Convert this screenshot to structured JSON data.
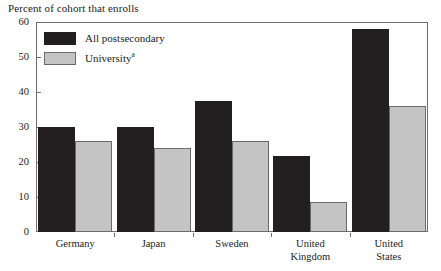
{
  "chart_data": {
    "type": "bar",
    "title": "Percent of cohort that enrolls",
    "xlabel": "",
    "ylabel": "",
    "ylim": [
      0,
      60
    ],
    "yticks": [
      0,
      10,
      20,
      30,
      40,
      50,
      60
    ],
    "grid": false,
    "legend_position": "top-left inside plot",
    "categories": [
      "Germany",
      "Japan",
      "Sweden",
      "United\nKingdom",
      "United\nStates"
    ],
    "category_labels_flat": [
      "Germany",
      "Japan",
      "Sweden",
      "United Kingdom",
      "United States"
    ],
    "series": [
      {
        "name": "All postsecondary",
        "color": "#231f20",
        "values": [
          30,
          30,
          37.5,
          21.8,
          58
        ]
      },
      {
        "name": "University",
        "name_superscript": "a",
        "color": "#c4c4c4",
        "values": [
          26,
          24,
          26,
          8.5,
          36
        ]
      }
    ]
  },
  "title": {
    "text": "Percent of cohort that enrolls"
  },
  "axes": {
    "y_tick_labels": [
      "60",
      "50",
      "40",
      "30",
      "20",
      "10",
      "0"
    ],
    "x_tick_labels": [
      "Germany",
      "Japan",
      "Sweden",
      "United\nKingdom",
      "United\nStates"
    ]
  },
  "legend": {
    "items": [
      {
        "label": "All postsecondary",
        "sup": ""
      },
      {
        "label": "University",
        "sup": "a"
      }
    ]
  },
  "colors": {
    "series_dark": "#231f20",
    "series_light": "#c4c4c4",
    "frame": "#6e6e6e",
    "text": "#1c1c1c",
    "background": "#ffffff"
  }
}
